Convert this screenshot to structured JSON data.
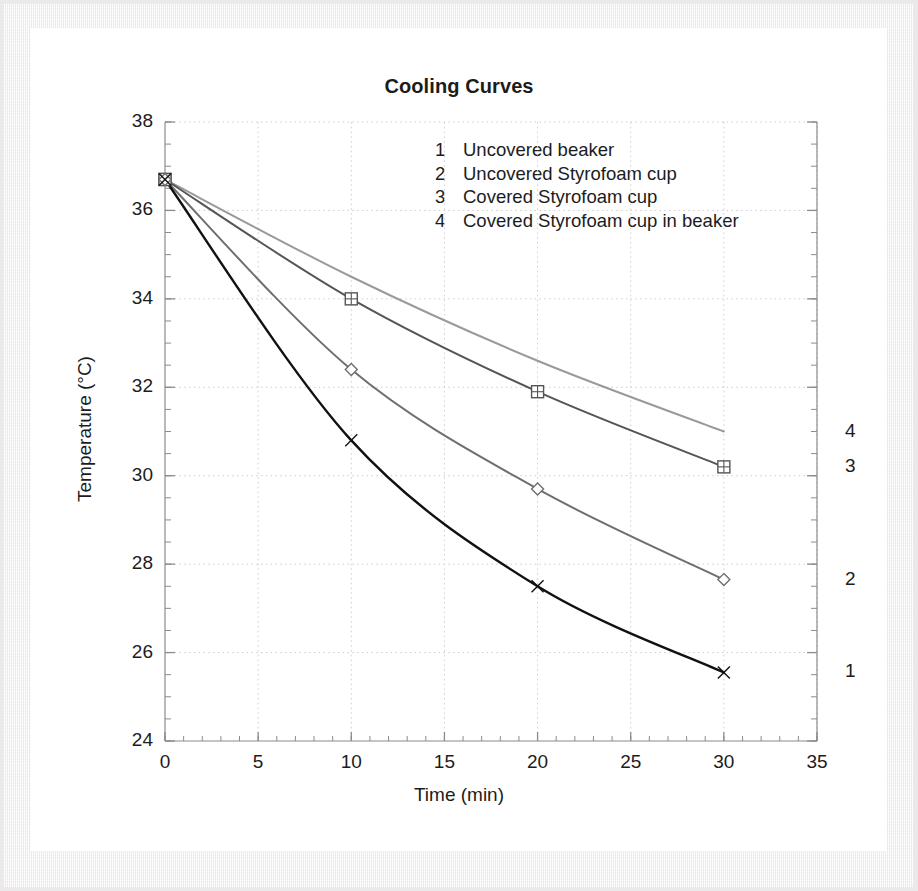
{
  "figure": {
    "title": "Cooling Curves",
    "xlabel": "Time (min)",
    "ylabel": "Temperature (°C)"
  },
  "legend": {
    "items": [
      {
        "num": "1",
        "label": "Uncovered beaker"
      },
      {
        "num": "2",
        "label": "Uncovered Styrofoam cup"
      },
      {
        "num": "3",
        "label": "Covered Styrofoam cup"
      },
      {
        "num": "4",
        "label": "Covered Styrofoam cup in beaker"
      }
    ]
  },
  "right_labels": [
    {
      "text": "4",
      "value": 31.0
    },
    {
      "text": "3",
      "value": 30.2
    },
    {
      "text": "2",
      "value": 27.65
    },
    {
      "text": "1",
      "value": 25.55
    }
  ],
  "axis": {
    "x_ticks": [
      "0",
      "5",
      "10",
      "15",
      "20",
      "25",
      "30",
      "35"
    ],
    "y_ticks": [
      "24",
      "26",
      "28",
      "30",
      "32",
      "34",
      "36",
      "38"
    ]
  },
  "colors": {
    "curve1": "#111111",
    "curve2": "#6f6f6f",
    "curve3": "#555555",
    "curve4": "#9a9a9a",
    "grid": "#cfcfcf",
    "axis": "#8c8c8c",
    "text": "#1c1c1c",
    "card": "#ffffff",
    "mat": "#f2f1f1"
  },
  "chart_data": {
    "type": "line",
    "title": "Cooling Curves",
    "xlabel": "Time (min)",
    "ylabel": "Temperature (°C)",
    "xlim": [
      0,
      35
    ],
    "ylim": [
      24,
      38
    ],
    "x_ticks": [
      0,
      5,
      10,
      15,
      20,
      25,
      30,
      35
    ],
    "y_ticks": [
      24,
      26,
      28,
      30,
      32,
      34,
      36,
      38
    ],
    "x_minor_step": 1,
    "y_minor_step": 0.5,
    "grid": true,
    "grid_style": "dotted",
    "legend_position": "upper right inside",
    "x": [
      0,
      10,
      20,
      30
    ],
    "series": [
      {
        "name": "Uncovered beaker",
        "number": 1,
        "marker": "x",
        "color": "#111111",
        "values": [
          36.7,
          30.8,
          27.5,
          25.55
        ]
      },
      {
        "name": "Uncovered Styrofoam cup",
        "number": 2,
        "marker": "diamond",
        "color": "#6f6f6f",
        "values": [
          36.7,
          32.4,
          29.7,
          27.65
        ]
      },
      {
        "name": "Covered Styrofoam cup",
        "number": 3,
        "marker": "square-plus",
        "color": "#555555",
        "values": [
          36.7,
          34.0,
          31.9,
          30.2
        ]
      },
      {
        "name": "Covered Styrofoam cup in beaker",
        "number": 4,
        "marker": "none",
        "color": "#9a9a9a",
        "values": [
          36.7,
          34.5,
          32.6,
          31.0
        ]
      }
    ]
  }
}
